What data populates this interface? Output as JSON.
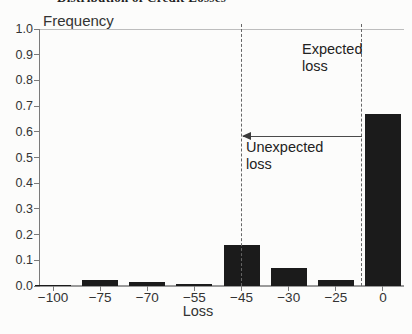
{
  "page": {
    "clipped_title": "Distribution of Credit Losses"
  },
  "chart_data": {
    "type": "bar",
    "ylabel": "Frequency",
    "xlabel": "Loss",
    "categories": [
      "−100",
      "−75",
      "−70",
      "−55",
      "−45",
      "−30",
      "−25",
      "0"
    ],
    "values": [
      0.003,
      0.025,
      0.015,
      0.006,
      0.16,
      0.07,
      0.022,
      0.67
    ],
    "y_ticks": [
      "1.0",
      "0.9",
      "0.8",
      "0.7",
      "0.6",
      "0.5",
      "0.4",
      "0.3",
      "0.2",
      "0.1",
      "0.0"
    ],
    "ylim": [
      0,
      1.0
    ],
    "grid": "off",
    "legend": "none",
    "bar_color": "#1b1b1b",
    "background_color": "#fcfcfb",
    "vlines": {
      "style": "dashed",
      "category_positions": [
        4.0,
        6.55
      ],
      "meaning": [
        "boundary at loss −45",
        "boundary near expected loss left of 0"
      ]
    },
    "arrow": {
      "y_value": 0.58,
      "spans_between_vlines": true,
      "head": "left"
    },
    "annotations": {
      "expected_loss_lines": [
        "Expected",
        "loss"
      ],
      "unexpected_loss_lines": [
        "Unexpected",
        "loss"
      ]
    }
  }
}
